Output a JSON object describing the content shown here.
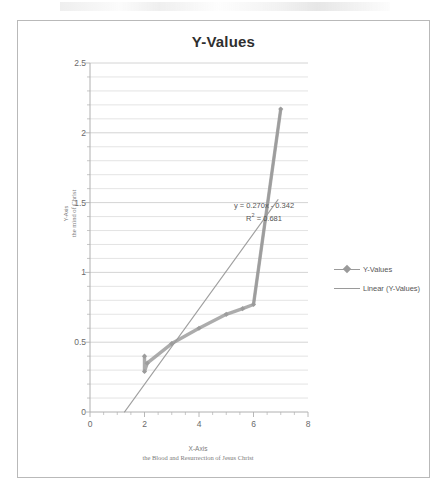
{
  "chart_data": {
    "type": "scatter",
    "title": "Y-Values",
    "xlabel": "X-Axis",
    "xlabel_sub": "the Blood and Resurrection of Jesus Christ",
    "ylabel": "Y-Axis",
    "ylabel_sub": "the mind of Christ",
    "xlim": [
      0,
      8
    ],
    "ylim": [
      0,
      2.5
    ],
    "x_ticks": [
      "0",
      "2",
      "4",
      "6",
      "8"
    ],
    "x_tick_values": [
      0,
      2,
      4,
      6,
      8
    ],
    "y_ticks": [
      "0",
      "0.5",
      "1",
      "1.5",
      "2",
      "2.5"
    ],
    "y_tick_values": [
      0,
      0.5,
      1,
      1.5,
      2,
      2.5
    ],
    "grid": "horizontal-minor-0.1",
    "legend_position": "right",
    "series": [
      {
        "name": "Y-Values",
        "marker": "diamond",
        "color": "#9a9a9a",
        "x": [
          2.0,
          2.0,
          2.1,
          3.0,
          4.0,
          5.0,
          5.6,
          6.0,
          7.0
        ],
        "y": [
          0.4,
          0.29,
          0.35,
          0.49,
          0.6,
          0.7,
          0.74,
          0.77,
          2.17
        ]
      },
      {
        "name": "Linear (Y-Values)",
        "type": "trendline",
        "color": "#8f8f8f",
        "slope": 0.27,
        "intercept": -0.342,
        "x_range": [
          1.27,
          6.9
        ]
      }
    ],
    "annotations": [
      {
        "text": "y = 0.270x - 0.342",
        "x": 4.0,
        "y": 1.62
      },
      {
        "text": "R² = 0.681",
        "x": 4.1,
        "y": 1.53
      }
    ],
    "colors": {
      "frame": "#b9b9b9",
      "grid": "#d8d8d8",
      "axis": "#b0b0b0",
      "series": "#9a9a9a",
      "title": "#2f2f2f",
      "tick_text": "#6a6a6a",
      "axis_title_text": "#7b7b7b"
    }
  },
  "annotation": {
    "equation": "y = 0.270x - 0.342",
    "r_squared_prefix": "R",
    "r_squared_sup": "2",
    "r_squared_value": " = 0.681"
  },
  "legend": {
    "items": [
      {
        "label": "Y-Values"
      },
      {
        "label": "Linear (Y-Values)"
      }
    ]
  }
}
